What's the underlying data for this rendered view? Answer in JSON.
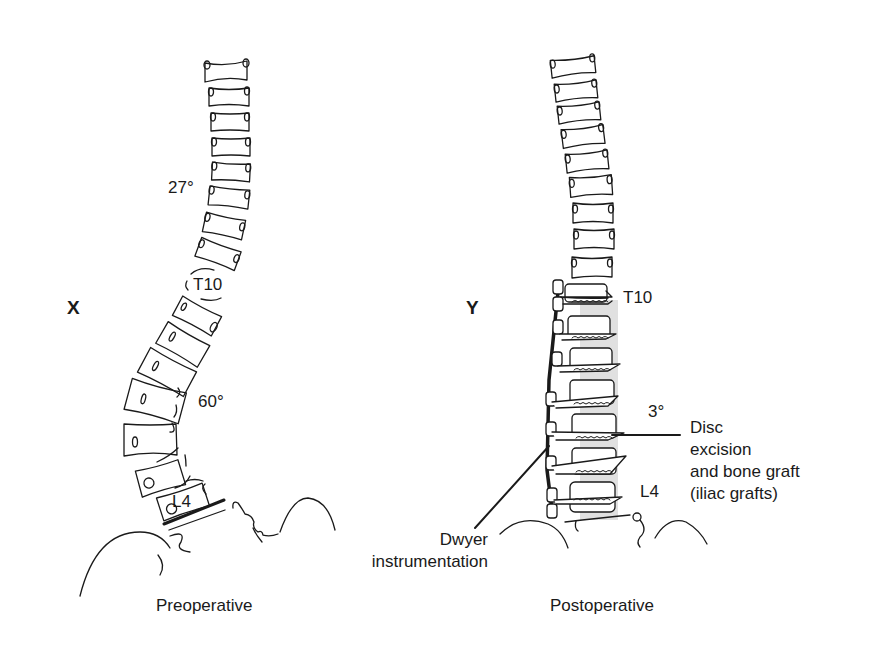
{
  "panels": [
    {
      "id": "X",
      "caption": "Preoperative",
      "labels": {
        "upper_angle": "27°",
        "level_top": "T10",
        "lower_angle": "60°",
        "level_bottom": "L4"
      }
    },
    {
      "id": "Y",
      "caption": "Postoperative",
      "labels": {
        "level_top": "T10",
        "angle": "3°",
        "level_bottom": "L4"
      },
      "annotations": {
        "disc": [
          "Disc",
          "excision",
          "and bone graft",
          "(iliac grafts)"
        ],
        "instrumentation": [
          "Dwyer",
          "instrumentation"
        ]
      }
    }
  ],
  "colors": {
    "line": "#1a1a1a",
    "graft": "#d6d6d6",
    "background": "#ffffff"
  }
}
